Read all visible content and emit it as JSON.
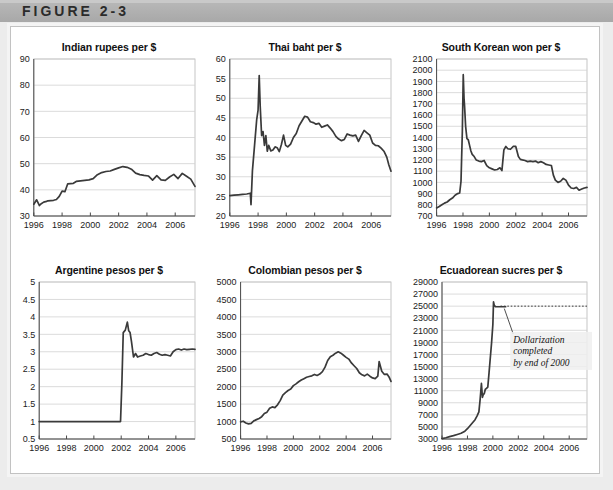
{
  "figure": {
    "label": "FIGURE 2-3"
  },
  "chart_data": [
    {
      "id": "indian-rupees",
      "type": "line",
      "title": "Indian rupees per $",
      "xlabel": "",
      "ylabel": "",
      "xlim": [
        1996,
        2007.4
      ],
      "ylim": [
        30,
        90
      ],
      "yticks": [
        30,
        40,
        50,
        60,
        70,
        80,
        90
      ],
      "xticks": [
        1996,
        1998,
        2000,
        2002,
        2004,
        2006
      ],
      "grid": true,
      "legend": "none",
      "x": [
        1996.0,
        1996.2,
        1996.4,
        1996.5,
        1996.7,
        1996.9,
        1997.0,
        1997.2,
        1997.4,
        1997.6,
        1997.8,
        1998.0,
        1998.2,
        1998.4,
        1998.6,
        1998.8,
        1999.0,
        1999.3,
        1999.6,
        1999.9,
        2000.2,
        2000.5,
        2000.8,
        2001.1,
        2001.4,
        2001.7,
        2002.0,
        2002.3,
        2002.6,
        2002.9,
        2003.2,
        2003.5,
        2003.8,
        2004.1,
        2004.4,
        2004.7,
        2005.0,
        2005.3,
        2005.6,
        2005.9,
        2006.2,
        2006.5,
        2006.8,
        2007.1,
        2007.4
      ],
      "values": [
        34.5,
        36.2,
        34.0,
        34.6,
        35.3,
        35.6,
        35.8,
        35.9,
        36.0,
        36.3,
        37.5,
        39.5,
        39.3,
        42.3,
        42.4,
        42.5,
        43.2,
        43.4,
        43.6,
        43.8,
        44.3,
        45.8,
        46.6,
        47.0,
        47.2,
        47.8,
        48.4,
        48.9,
        48.6,
        47.9,
        46.4,
        45.8,
        45.5,
        45.3,
        43.7,
        45.4,
        43.8,
        43.6,
        44.9,
        45.9,
        44.3,
        46.3,
        45.2,
        44.1,
        41.3
      ]
    },
    {
      "id": "thai-baht",
      "type": "line",
      "title": "Thai baht per $",
      "xlabel": "",
      "ylabel": "",
      "xlim": [
        1996,
        2007.4
      ],
      "ylim": [
        20,
        60
      ],
      "yticks": [
        20,
        25,
        30,
        35,
        40,
        45,
        50,
        55,
        60
      ],
      "xticks": [
        1996,
        1998,
        2000,
        2002,
        2004,
        2006
      ],
      "grid": true,
      "legend": "none",
      "x": [
        1996.0,
        1996.3,
        1996.6,
        1996.9,
        1997.2,
        1997.45,
        1997.5,
        1997.6,
        1997.75,
        1997.9,
        1998.0,
        1998.08,
        1998.15,
        1998.25,
        1998.35,
        1998.45,
        1998.55,
        1998.65,
        1998.75,
        1998.9,
        1999.05,
        1999.2,
        1999.35,
        1999.5,
        1999.65,
        1999.8,
        1999.95,
        2000.1,
        2000.3,
        2000.5,
        2000.7,
        2000.9,
        2001.1,
        2001.3,
        2001.5,
        2001.7,
        2001.9,
        2002.1,
        2002.3,
        2002.5,
        2002.7,
        2002.9,
        2003.1,
        2003.3,
        2003.5,
        2003.7,
        2003.9,
        2004.1,
        2004.3,
        2004.5,
        2004.7,
        2004.9,
        2005.1,
        2005.3,
        2005.5,
        2005.7,
        2005.9,
        2006.1,
        2006.3,
        2006.5,
        2006.7,
        2006.9,
        2007.1,
        2007.25,
        2007.4
      ],
      "values": [
        25.2,
        25.3,
        25.4,
        25.5,
        25.6,
        25.8,
        22.9,
        31.5,
        38.0,
        44.5,
        47.0,
        55.8,
        48.0,
        40.5,
        41.5,
        38.0,
        40.5,
        36.5,
        38.0,
        36.6,
        36.8,
        37.6,
        37.4,
        36.4,
        38.2,
        40.6,
        38.0,
        37.6,
        38.3,
        40.0,
        41.0,
        43.0,
        44.2,
        45.4,
        45.2,
        44.0,
        43.8,
        43.4,
        43.6,
        42.6,
        42.9,
        43.2,
        42.4,
        41.5,
        40.3,
        39.6,
        39.2,
        39.5,
        40.9,
        40.6,
        40.4,
        40.6,
        39.0,
        40.5,
        41.8,
        41.2,
        40.6,
        38.6,
        38.0,
        37.9,
        37.3,
        36.5,
        35.0,
        33.0,
        31.4
      ]
    },
    {
      "id": "south-korean-won",
      "type": "line",
      "title": "South Korean won per $",
      "xlabel": "",
      "ylabel": "",
      "xlim": [
        1996,
        2007.4
      ],
      "ylim": [
        700,
        2100
      ],
      "yticks": [
        700,
        800,
        900,
        1000,
        1100,
        1200,
        1300,
        1400,
        1500,
        1600,
        1700,
        1800,
        1900,
        2000,
        2100
      ],
      "xticks": [
        1996,
        1998,
        2000,
        2002,
        2004,
        2006
      ],
      "grid": true,
      "legend": "none",
      "x": [
        1996.0,
        1996.2,
        1996.4,
        1996.6,
        1996.8,
        1997.0,
        1997.2,
        1997.4,
        1997.6,
        1997.75,
        1997.85,
        1997.95,
        1998.02,
        1998.08,
        1998.12,
        1998.2,
        1998.3,
        1998.4,
        1998.5,
        1998.6,
        1998.7,
        1998.85,
        1999.0,
        1999.2,
        1999.4,
        1999.6,
        1999.8,
        2000.0,
        2000.2,
        2000.4,
        2000.6,
        2000.8,
        2000.95,
        2001.1,
        2001.25,
        2001.4,
        2001.6,
        2001.8,
        2002.0,
        2002.2,
        2002.35,
        2002.5,
        2002.7,
        2002.9,
        2003.1,
        2003.3,
        2003.5,
        2003.7,
        2003.9,
        2004.1,
        2004.3,
        2004.5,
        2004.7,
        2004.85,
        2005.0,
        2005.2,
        2005.4,
        2005.6,
        2005.8,
        2006.0,
        2006.2,
        2006.4,
        2006.6,
        2006.8,
        2007.0,
        2007.2,
        2007.4
      ],
      "values": [
        772,
        785,
        800,
        815,
        825,
        845,
        860,
        885,
        900,
        905,
        1010,
        1450,
        1960,
        1750,
        1680,
        1500,
        1390,
        1380,
        1330,
        1280,
        1250,
        1230,
        1200,
        1190,
        1185,
        1195,
        1150,
        1130,
        1120,
        1110,
        1115,
        1130,
        1105,
        1290,
        1320,
        1300,
        1295,
        1320,
        1320,
        1230,
        1205,
        1200,
        1195,
        1185,
        1190,
        1185,
        1190,
        1175,
        1185,
        1175,
        1160,
        1155,
        1150,
        1065,
        1020,
        1000,
        1010,
        1035,
        1020,
        975,
        950,
        945,
        955,
        930,
        940,
        950,
        955
      ]
    },
    {
      "id": "argentine-pesos",
      "type": "line",
      "title": "Argentine pesos per $",
      "xlabel": "",
      "ylabel": "",
      "xlim": [
        1996,
        2007.4
      ],
      "ylim": [
        0.5,
        5.0
      ],
      "yticks": [
        0.5,
        1.0,
        1.5,
        2.0,
        2.5,
        3.0,
        3.5,
        4.0,
        4.5,
        5.0
      ],
      "xticks": [
        1996,
        1998,
        2000,
        2002,
        2004,
        2006
      ],
      "grid": true,
      "legend": "none",
      "x": [
        1996.0,
        1997.0,
        1998.0,
        1999.0,
        2000.0,
        2001.0,
        2001.95,
        2002.05,
        2002.15,
        2002.3,
        2002.45,
        2002.55,
        2002.65,
        2002.75,
        2002.9,
        2003.05,
        2003.2,
        2003.4,
        2003.6,
        2003.8,
        2004.0,
        2004.2,
        2004.4,
        2004.6,
        2004.8,
        2005.0,
        2005.2,
        2005.4,
        2005.6,
        2005.8,
        2006.0,
        2006.2,
        2006.4,
        2006.6,
        2006.8,
        2007.0,
        2007.2,
        2007.4
      ],
      "values": [
        1.0,
        1.0,
        1.0,
        1.0,
        1.0,
        1.0,
        1.0,
        2.1,
        3.55,
        3.62,
        3.85,
        3.6,
        3.55,
        3.3,
        2.85,
        2.95,
        2.85,
        2.88,
        2.9,
        2.95,
        2.92,
        2.9,
        2.95,
        2.98,
        2.93,
        2.9,
        2.92,
        2.9,
        2.88,
        3.0,
        3.06,
        3.08,
        3.05,
        3.08,
        3.06,
        3.07,
        3.08,
        3.07
      ]
    },
    {
      "id": "colombian-pesos",
      "type": "line",
      "title": "Colombian pesos per $",
      "xlabel": "",
      "ylabel": "",
      "xlim": [
        1996,
        2007.4
      ],
      "ylim": [
        500,
        5000
      ],
      "yticks": [
        500,
        1000,
        1500,
        2000,
        2500,
        3000,
        3500,
        4000,
        4500,
        5000
      ],
      "xticks": [
        1996,
        1998,
        2000,
        2002,
        2004,
        2006
      ],
      "grid": true,
      "legend": "none",
      "x": [
        1996.0,
        1996.2,
        1996.4,
        1996.6,
        1996.8,
        1997.0,
        1997.2,
        1997.4,
        1997.6,
        1997.8,
        1998.0,
        1998.2,
        1998.4,
        1998.6,
        1998.8,
        1999.0,
        1999.2,
        1999.4,
        1999.6,
        1999.8,
        2000.0,
        2000.2,
        2000.4,
        2000.6,
        2000.8,
        2001.0,
        2001.2,
        2001.4,
        2001.6,
        2001.8,
        2002.0,
        2002.2,
        2002.4,
        2002.6,
        2002.8,
        2003.0,
        2003.2,
        2003.4,
        2003.6,
        2003.8,
        2004.0,
        2004.2,
        2004.4,
        2004.6,
        2004.8,
        2005.0,
        2005.2,
        2005.4,
        2005.6,
        2005.8,
        2006.0,
        2006.2,
        2006.4,
        2006.5,
        2006.7,
        2006.9,
        2007.1,
        2007.25,
        2007.4
      ],
      "values": [
        990,
        1010,
        960,
        935,
        950,
        1020,
        1055,
        1090,
        1140,
        1230,
        1270,
        1380,
        1420,
        1400,
        1480,
        1600,
        1760,
        1830,
        1890,
        1930,
        2030,
        2080,
        2140,
        2190,
        2230,
        2270,
        2290,
        2310,
        2350,
        2320,
        2360,
        2430,
        2560,
        2750,
        2860,
        2900,
        2960,
        3000,
        2960,
        2900,
        2840,
        2790,
        2680,
        2600,
        2520,
        2400,
        2340,
        2310,
        2360,
        2300,
        2250,
        2230,
        2300,
        2720,
        2440,
        2350,
        2360,
        2280,
        2150
      ]
    },
    {
      "id": "ecuadorean-sucres",
      "type": "line",
      "title": "Ecuadorean sucres per $",
      "xlabel": "",
      "ylabel": "",
      "xlim": [
        1996,
        2007.4
      ],
      "ylim": [
        3000,
        29000
      ],
      "yticks": [
        3000,
        5000,
        7000,
        9000,
        11000,
        13000,
        15000,
        17000,
        19000,
        21000,
        23000,
        25000,
        27000,
        29000
      ],
      "xticks": [
        1996,
        1998,
        2000,
        2002,
        2004,
        2006
      ],
      "grid": true,
      "legend": "none",
      "annotation": "Dollarization\ncompleted\nby end of 2000",
      "annotation_lines": [
        "Dollarization",
        "completed",
        "by end of 2000"
      ],
      "reference_value": 25000,
      "x": [
        1996.0,
        1996.3,
        1996.6,
        1996.9,
        1997.2,
        1997.5,
        1997.8,
        1998.0,
        1998.2,
        1998.4,
        1998.6,
        1998.75,
        1998.9,
        1999.0,
        1999.1,
        1999.18,
        1999.25,
        1999.32,
        1999.4,
        1999.5,
        1999.6,
        1999.7,
        1999.8,
        1999.9,
        2000.0,
        2000.05,
        2000.1,
        2000.2,
        2000.4,
        2000.7,
        2001.0
      ],
      "values": [
        3050,
        3200,
        3400,
        3550,
        3750,
        3950,
        4300,
        4700,
        5200,
        5700,
        6200,
        6800,
        7500,
        9600,
        12200,
        9900,
        10400,
        10500,
        11200,
        11400,
        11600,
        14000,
        16500,
        19000,
        22000,
        25700,
        25200,
        24900,
        24900,
        24900,
        24900
      ]
    }
  ]
}
